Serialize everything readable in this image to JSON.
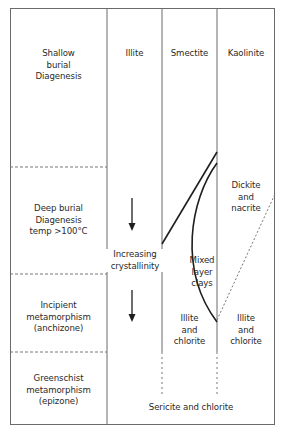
{
  "diagram": {
    "columns": [
      {
        "id": "illite",
        "label": "Illite"
      },
      {
        "id": "smectite",
        "label": "Smectite"
      },
      {
        "id": "kaolinite",
        "label": "Kaolinite"
      }
    ],
    "zones": [
      {
        "id": "shallow",
        "line1": "Shallow",
        "line2": "burial",
        "line3": "Diagenesis"
      },
      {
        "id": "deep",
        "line1": "Deep burial",
        "line2": "Diagenesis",
        "line3": "temp >100°C"
      },
      {
        "id": "incipient",
        "line1": "Incipient",
        "line2": "metamorphism",
        "line3": "(anchizone)"
      },
      {
        "id": "greenschist",
        "line1": "Greenschist",
        "line2": "metamorphism",
        "line3": "(epizone)"
      }
    ],
    "annotations": {
      "increasing_1": "Increasing",
      "increasing_2": "crystallinity",
      "mixed_1": "Mixed",
      "mixed_2": "layer",
      "mixed_3": "clays",
      "dickite_1": "Dickite",
      "dickite_2": "and",
      "dickite_3": "nacrite",
      "illite_chl_s_1": "Illite",
      "illite_chl_s_2": "and",
      "illite_chl_s_3": "chlorite",
      "illite_chl_k_1": "Illite",
      "illite_chl_k_2": "and",
      "illite_chl_k_3": "chlorite",
      "sericite": "Sericite and chlorite"
    },
    "colors": {
      "line": "#1e1e1e",
      "frame": "#6a6a6a",
      "dash": "#777777"
    }
  }
}
